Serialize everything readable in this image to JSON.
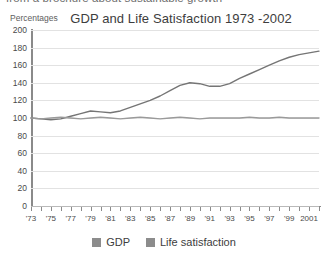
{
  "top_cutoff_text": "from a brochure about sustainable growth",
  "axis_unit_label": "Percentages",
  "legend": {
    "gdp_label": "GDP",
    "life_label": "Life satisfaction",
    "gdp_color": "#8c8c8c",
    "life_color": "#8c8c8c"
  },
  "chart_data": {
    "type": "line",
    "title": "GDP and Life Satisfaction 1973 -2002",
    "xlabel": "",
    "ylabel": "Percentages",
    "ylim": [
      0,
      200
    ],
    "xlim": [
      1973,
      2002
    ],
    "grid": true,
    "legend_position": "bottom",
    "ytick_labels": [
      "200",
      "180",
      "160",
      "140",
      "120",
      "100",
      "80",
      "60",
      "40",
      "20",
      "0"
    ],
    "ytick_values": [
      200,
      180,
      160,
      140,
      120,
      100,
      80,
      60,
      40,
      20,
      0
    ],
    "xtick_labels": [
      "'73",
      "'75",
      "'77",
      "'79",
      "'81",
      "'83",
      "'85",
      "'87",
      "'89",
      "'91",
      "'93",
      "'95",
      "'97",
      "'99",
      "2001"
    ],
    "xtick_values": [
      1973,
      1975,
      1977,
      1979,
      1981,
      1983,
      1985,
      1987,
      1989,
      1991,
      1993,
      1995,
      1997,
      1999,
      2001
    ],
    "x": [
      1973,
      1974,
      1975,
      1976,
      1977,
      1978,
      1979,
      1980,
      1981,
      1982,
      1983,
      1984,
      1985,
      1986,
      1987,
      1988,
      1989,
      1990,
      1991,
      1992,
      1993,
      1994,
      1995,
      1996,
      1997,
      1998,
      1999,
      2000,
      2001,
      2002
    ],
    "series": [
      {
        "name": "GDP",
        "color": "#757575",
        "values": [
          100,
          99,
          98,
          99,
          102,
          105,
          108,
          107,
          106,
          108,
          112,
          116,
          120,
          125,
          131,
          137,
          140,
          139,
          136,
          136,
          139,
          145,
          150,
          155,
          160,
          165,
          169,
          172,
          174,
          176
        ]
      },
      {
        "name": "Life satisfaction",
        "color": "#9a9a9a",
        "values": [
          100,
          99,
          100,
          101,
          100,
          99,
          100,
          101,
          100,
          99,
          100,
          101,
          100,
          99,
          100,
          101,
          100,
          99,
          100,
          100,
          100,
          100,
          101,
          100,
          100,
          101,
          100,
          100,
          100,
          100
        ]
      }
    ]
  }
}
